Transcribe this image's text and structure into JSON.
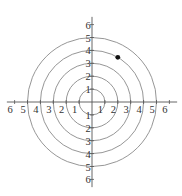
{
  "chart_data": {
    "type": "scatter",
    "subtype": "polar-grid",
    "title": "",
    "xlabel": "",
    "ylabel": "",
    "circles": [
      1,
      2,
      3,
      4,
      5
    ],
    "axis_range": [
      -6,
      6
    ],
    "x_tick_labels": [
      "6",
      "5",
      "4",
      "3",
      "2",
      "1",
      "1",
      "2",
      "3",
      "4",
      "5",
      "6"
    ],
    "x_tick_values": [
      -6,
      -5,
      -4,
      -3,
      -2,
      -1,
      1,
      2,
      3,
      4,
      5,
      6
    ],
    "y_tick_labels": [
      "6",
      "5",
      "4",
      "3",
      "2",
      "1",
      "1",
      "2",
      "3",
      "4",
      "5",
      "6"
    ],
    "y_tick_values": [
      6,
      5,
      4,
      3,
      2,
      1,
      -1,
      -2,
      -3,
      -4,
      -5,
      -6
    ],
    "points": [
      {
        "r": 4,
        "theta_deg": 60
      }
    ],
    "grid": true,
    "legend": "none",
    "colors": {
      "grid": "#8a8a8a",
      "axis": "#555555",
      "point": "#111111",
      "text": "#333333"
    }
  }
}
